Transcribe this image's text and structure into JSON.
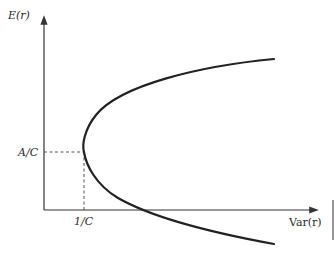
{
  "diagram": {
    "y_axis_label": "E(r)",
    "x_axis_label": "Var(r)",
    "y_tick_label": "A/C",
    "x_tick_label": "1/C",
    "colors": {
      "curve": "#222222",
      "axes": "#333333",
      "dashed": "#555555",
      "background": "#ffffff"
    }
  }
}
